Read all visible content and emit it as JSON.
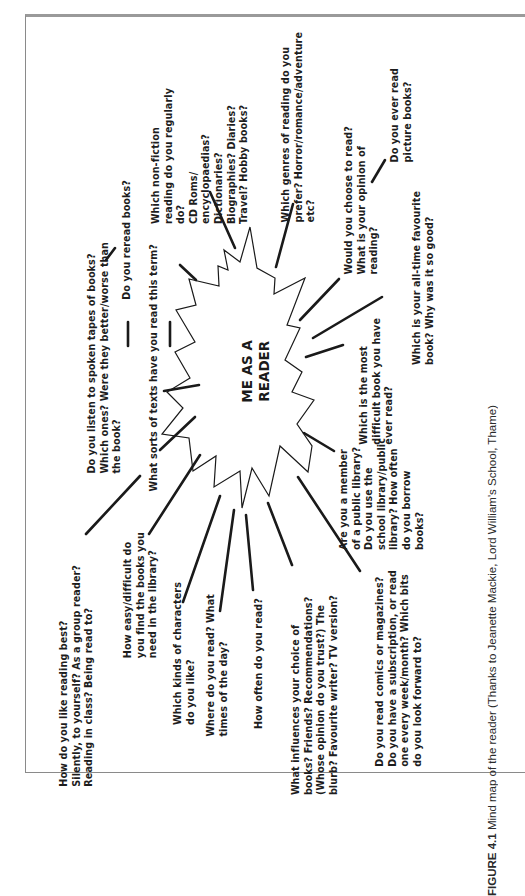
{
  "diagram": {
    "type": "mind-map",
    "center": {
      "label": "ME AS A\nREADER"
    },
    "nodes": [
      {
        "id": "reading-best",
        "text": "How do you like reading best?\nSilently, to yourself? As a group reader?\nReading in class? Being read to?"
      },
      {
        "id": "find-books",
        "text": "How easy/difficult do\nyou find the books you\nneed in the library?"
      },
      {
        "id": "characters",
        "text": "Which kinds of characters\ndo you like?"
      },
      {
        "id": "where-read",
        "text": "Where do you read? What\ntimes of the day?"
      },
      {
        "id": "how-often",
        "text": "How often do you read?"
      },
      {
        "id": "influences",
        "text": "What influences your choice of\nbooks? Friends? Recommendations?\n(Whose opinion do you trust?) The\nblurb? Favourite writer? TV version?"
      },
      {
        "id": "comics",
        "text": "Do you read comics or magazines?\nDo you have a subscription, or read\none every week/month? Which bits\ndo you look forward to?"
      },
      {
        "id": "library",
        "text": "Are you a member\nof a public library?\nDo you use the\nschool library/public\nlibrary? How often\ndo you borrow\nbooks?"
      },
      {
        "id": "most-difficult",
        "text": "Which is the most\ndifficult book you have\never read?"
      },
      {
        "id": "favourite",
        "text": "Which is your all-time favourite\nbook? Why was it so good?"
      },
      {
        "id": "choose",
        "text": "Would you choose to read?\nWhat is your opinion of\nreading?"
      },
      {
        "id": "picture-books",
        "text": "Do you ever read\npicture books?"
      },
      {
        "id": "genres",
        "text": "Which genres of reading do you\nprefer? Horror/romance/adventure\netc?"
      },
      {
        "id": "non-fiction",
        "text": "Which non-fiction\nreading do you regularly\ndo?\nCD Roms/\nencyclopaedias?\nDictionaries?\nBiographies? Diaries?\nTravel? Hobby books?"
      },
      {
        "id": "reread",
        "text": "Do you reread books?"
      },
      {
        "id": "tapes",
        "text": "Do you listen to spoken tapes of books?\nWhich ones? Were they better/worse than\nthe book?"
      },
      {
        "id": "sorts-texts",
        "text": "What sorts of texts have you read this term?"
      }
    ],
    "caption": {
      "label": "FIGURE 4.1",
      "text": " Mind map of the reader (Thanks to Jeanette Mackie, Lord William's School, Thame)"
    }
  }
}
